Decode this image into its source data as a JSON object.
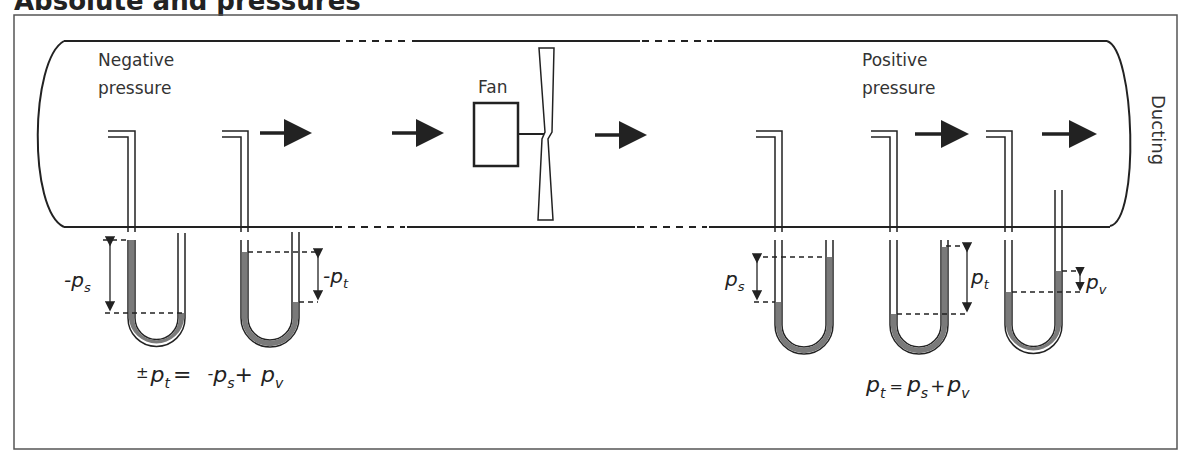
{
  "title": "Absolute and pressures",
  "labels": {
    "negative_line1": "Negative",
    "negative_line2": "pressure",
    "positive_line1": "Positive",
    "positive_line2": "pressure",
    "fan": "Fan",
    "ducting": "Ducting"
  },
  "gauges": {
    "neg_static": {
      "sign": "-",
      "symbol": "p",
      "sub": "s"
    },
    "neg_total": {
      "sign": "-",
      "symbol": "p",
      "sub": "t"
    },
    "pos_static": {
      "symbol": "p",
      "sub": "s"
    },
    "pos_total": {
      "symbol": "p",
      "sub": "t"
    },
    "pos_velocity": {
      "symbol": "p",
      "sub": "v"
    }
  },
  "equations": {
    "negative": {
      "pm": "±",
      "lhs_p": "p",
      "lhs_sub": "t",
      "eq": "=",
      "t1_sign": "-",
      "t1_p": "p",
      "t1_sub": "s",
      "plus": "+",
      "t2_p": "p",
      "t2_sub": "v"
    },
    "positive": {
      "lhs_p": "p",
      "lhs_sub": "t",
      "eq": "=",
      "t1_p": "p",
      "t1_sub": "s",
      "plus": "+",
      "t2_p": "p",
      "t2_sub": "v"
    }
  },
  "colors": {
    "line": "#222222",
    "fluid": "#7a7a7a",
    "frame": "#555555"
  }
}
